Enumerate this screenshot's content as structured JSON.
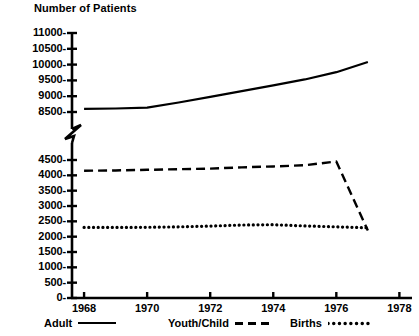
{
  "chart_data": {
    "type": "line",
    "title": "Number of Patients",
    "ylabel": "Number of Patients",
    "xlabel": "",
    "x": [
      1968,
      1969,
      1970,
      1971,
      1972,
      1973,
      1974,
      1975,
      1976,
      1977
    ],
    "xlim": [
      1967.3,
      1978.4
    ],
    "xticks": [
      1968,
      1970,
      1972,
      1974,
      1976,
      1978
    ],
    "xtick_labels": [
      "1968",
      "1970",
      "1972",
      "1974",
      "1976",
      "1978"
    ],
    "yticks_lower": [
      0,
      500,
      1000,
      1500,
      2000,
      2500,
      3000,
      3500,
      4000,
      4500
    ],
    "ytick_labels_lower": [
      "0-",
      "500-",
      "1000-",
      "1500-",
      "2000-",
      "2500-",
      "3000-",
      "3500-",
      "4000-",
      "4500-"
    ],
    "yticks_upper": [
      8500,
      9000,
      9500,
      10000,
      10500,
      11000
    ],
    "ytick_labels_upper": [
      "8500-",
      "9000-",
      "9500-",
      "10000-",
      "10500-",
      "11000-"
    ],
    "axis_break": {
      "present": true,
      "between": [
        4500,
        8500
      ],
      "style": "zigzag"
    },
    "grid": false,
    "legend_position": "below-axis",
    "series": [
      {
        "name": "Adult",
        "style": "solid",
        "values": [
          8600,
          8610,
          8640,
          8800,
          8980,
          9160,
          9340,
          9530,
          9760,
          10080
        ]
      },
      {
        "name": "Youth/Child",
        "style": "dashed",
        "values": [
          4150,
          4160,
          4180,
          4200,
          4220,
          4260,
          4290,
          4330,
          4450,
          4750
        ]
      },
      {
        "name": "Births",
        "style": "dotted",
        "values": [
          2300,
          2300,
          2305,
          2320,
          2345,
          2380,
          2390,
          2350,
          2320,
          2290
        ]
      }
    ]
  },
  "legend": {
    "entries": [
      {
        "label": "Adult",
        "style": "solid"
      },
      {
        "label": "Youth/Child",
        "style": "dashed"
      },
      {
        "label": "Births",
        "style": "dotted"
      }
    ]
  }
}
